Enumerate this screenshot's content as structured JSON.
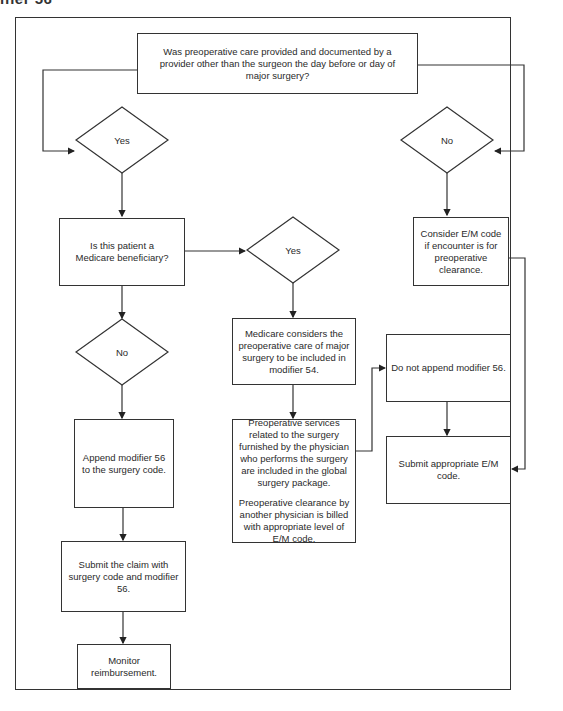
{
  "page": {
    "heading_fragment": "ifier 56"
  },
  "flowchart": {
    "start_question": "Was preoperative care provided and documented by a provider other than the surgeon the day before or day of major surgery?",
    "decisions": {
      "yes_top": "Yes",
      "no_top": "No",
      "yes_medicare": "Yes",
      "no_medicare": "No"
    },
    "medicare_question": "Is this patient a Medicare beneficiary?",
    "consider_em": "Consider E/M code if encounter is for preoperative clearance.",
    "medicare_considers": "Medicare considers the preoperative care of major surgery to be included in modifier 54.",
    "preop_services": "Preoperative services related to the surgery furnished by the physician who performs the surgery are included in the global surgery package.",
    "preop_clearance": "Preoperative clearance by another physician is billed with appropriate level of E/M code.",
    "do_not_append": "Do not append modifier 56.",
    "submit_em": "Submit appropriate E/M code.",
    "append_modifier": "Append modifier 56 to the surgery code.",
    "submit_claim": "Submit the claim with surgery code and modifier 56.",
    "monitor": "Monitor reimbursement."
  }
}
